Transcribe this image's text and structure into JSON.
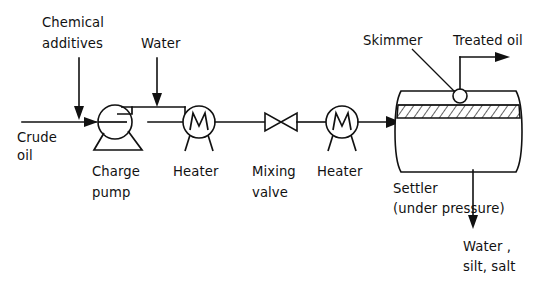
{
  "diagram": {
    "background_color": "#ffffff",
    "line_color": "#111111",
    "labels": {
      "chemical_additives_line1": "Chemical",
      "chemical_additives_line2": "additives",
      "water_inlet": "Water",
      "crude_oil_line1": "Crude",
      "crude_oil_line2": "oil",
      "charge_pump_line1": "Charge",
      "charge_pump_line2": "pump",
      "heater_1": "Heater",
      "mixing_valve_line1": "Mixing",
      "mixing_valve_line2": "valve",
      "heater_2": "Heater",
      "settler_line1": "Settler",
      "settler_line2": "(under pressure)",
      "skimmer": "Skimmer",
      "treated_oil": "Treated oil",
      "water_outlet_line1": "Water ,",
      "water_outlet_line2": "silt, salt"
    },
    "equipment": [
      {
        "id": "charge-pump",
        "name": "Charge pump",
        "symbol": "centrifugal-pump"
      },
      {
        "id": "heater-1",
        "name": "Heater",
        "symbol": "heater-circle-m"
      },
      {
        "id": "mixing-valve",
        "name": "Mixing valve",
        "symbol": "bowtie-valve"
      },
      {
        "id": "heater-2",
        "name": "Heater",
        "symbol": "heater-circle-m"
      },
      {
        "id": "settler",
        "name": "Settler (under pressure)",
        "symbol": "horizontal-drum-vessel"
      },
      {
        "id": "skimmer",
        "name": "Skimmer",
        "symbol": "small-circle-nozzle"
      }
    ],
    "streams": [
      {
        "id": "crude-oil-feed",
        "name": "Crude oil",
        "direction": "right"
      },
      {
        "id": "chemical-additives-feed",
        "name": "Chemical additives",
        "direction": "down"
      },
      {
        "id": "water-feed",
        "name": "Water",
        "direction": "down"
      },
      {
        "id": "treated-oil-product",
        "name": "Treated oil",
        "direction": "right"
      },
      {
        "id": "water-silt-salt-drain",
        "name": "Water, silt, salt",
        "direction": "down"
      }
    ]
  }
}
